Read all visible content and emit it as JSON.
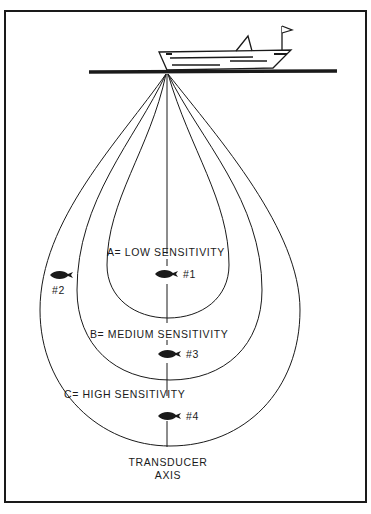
{
  "diagram": {
    "zones": [
      {
        "label": "A= LOW SENSITIVITY"
      },
      {
        "label": "B= MEDIUM SENSITIVITY"
      },
      {
        "label": "C= HIGH SENSITIVITY"
      }
    ],
    "fish": [
      {
        "label": "#1"
      },
      {
        "label": "#2"
      },
      {
        "label": "#3"
      },
      {
        "label": "#4"
      }
    ],
    "axis_label_line1": "TRANSDUCER",
    "axis_label_line2": "AXIS",
    "colors": {
      "ink": "#1a1a1a",
      "paper": "#ffffff"
    }
  }
}
